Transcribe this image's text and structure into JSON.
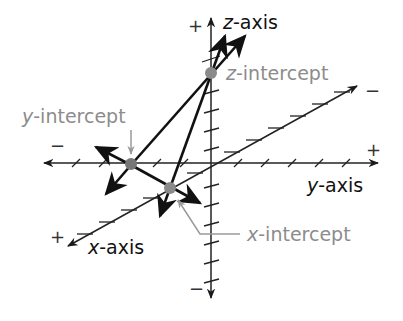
{
  "diagram": {
    "type": "3d-coordinate-plane-intercepts",
    "colors": {
      "axis": "#222222",
      "trace": "#111111",
      "intercept_point": "#8a8a8a",
      "annotation": "#8c8c8c",
      "axis_label": "#111111"
    },
    "axes": {
      "z": {
        "var": "z",
        "suffix": "-axis",
        "positive_sign": "+",
        "negative_sign": "−"
      },
      "y": {
        "var": "y",
        "suffix": "-axis",
        "positive_sign": "+",
        "negative_sign": "−"
      },
      "x": {
        "var": "x",
        "suffix": "-axis",
        "positive_sign": "+",
        "negative_sign": "−"
      }
    },
    "intercepts": {
      "z": {
        "var": "z",
        "suffix": "-intercept"
      },
      "y": {
        "var": "y",
        "suffix": "-intercept"
      },
      "x": {
        "var": "x",
        "suffix": "-intercept"
      }
    }
  }
}
